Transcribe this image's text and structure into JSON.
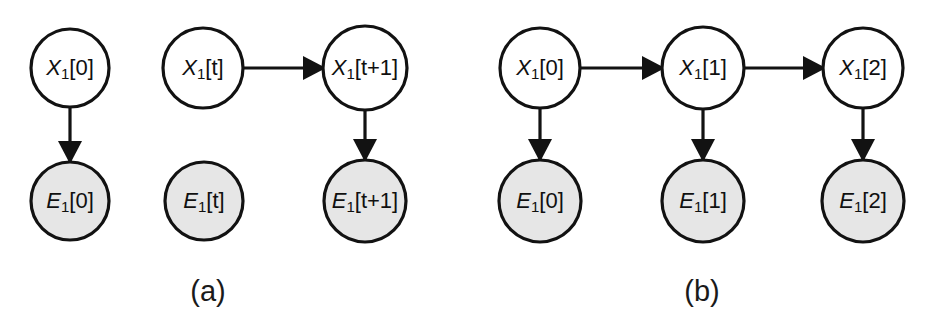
{
  "figure": {
    "background_color": "#ffffff",
    "stroke_color": "#121212",
    "hidden_node_fill": "#ffffff",
    "evidence_node_fill": "#e6e6e6",
    "panels": [
      {
        "id": "a",
        "caption": "(a)",
        "caption_x": 208,
        "caption_y": 293,
        "nodes": [
          {
            "id": "a-x0",
            "kind": "hidden",
            "var": "X",
            "sub": "1",
            "index": "[0]",
            "cx": 70,
            "cy": 68,
            "r": 39
          },
          {
            "id": "a-e0",
            "kind": "evidence",
            "var": "E",
            "sub": "1",
            "index": "[0]",
            "cx": 70,
            "cy": 201,
            "r": 39
          },
          {
            "id": "a-xt",
            "kind": "hidden",
            "var": "X",
            "sub": "1",
            "index": "[t]",
            "cx": 203,
            "cy": 68,
            "r": 40
          },
          {
            "id": "a-et",
            "kind": "evidence",
            "var": "E",
            "sub": "1",
            "index": "[t]",
            "cx": 204,
            "cy": 201,
            "r": 39
          },
          {
            "id": "a-xt1",
            "kind": "hidden",
            "var": "X",
            "sub": "1",
            "index": "[t+1]",
            "cx": 365,
            "cy": 68,
            "r": 42
          },
          {
            "id": "a-et1",
            "kind": "evidence",
            "var": "E",
            "sub": "1",
            "index": "[t+1]",
            "cx": 365,
            "cy": 201,
            "r": 41
          }
        ],
        "edges": [
          {
            "id": "a-edge-x0-e0",
            "from": "a-x0",
            "to": "a-e0",
            "direction": "down"
          },
          {
            "id": "a-edge-xt-xt1",
            "from": "a-xt",
            "to": "a-xt1",
            "direction": "right"
          },
          {
            "id": "a-edge-xt1-et1",
            "from": "a-xt1",
            "to": "a-et1",
            "direction": "down"
          }
        ]
      },
      {
        "id": "b",
        "caption": "(b)",
        "caption_x": 702,
        "caption_y": 293,
        "nodes": [
          {
            "id": "b-x0",
            "kind": "hidden",
            "var": "X",
            "sub": "1",
            "index": "[0]",
            "cx": 540,
            "cy": 68,
            "r": 40
          },
          {
            "id": "b-x1",
            "kind": "hidden",
            "var": "X",
            "sub": "1",
            "index": "[1]",
            "cx": 703,
            "cy": 68,
            "r": 41
          },
          {
            "id": "b-x2",
            "kind": "hidden",
            "var": "X",
            "sub": "1",
            "index": "[2]",
            "cx": 863,
            "cy": 68,
            "r": 40
          },
          {
            "id": "b-e0",
            "kind": "evidence",
            "var": "E",
            "sub": "1",
            "index": "[0]",
            "cx": 540,
            "cy": 201,
            "r": 41
          },
          {
            "id": "b-e1",
            "kind": "evidence",
            "var": "E",
            "sub": "1",
            "index": "[1]",
            "cx": 703,
            "cy": 201,
            "r": 41
          },
          {
            "id": "b-e2",
            "kind": "evidence",
            "var": "E",
            "sub": "1",
            "index": "[2]",
            "cx": 863,
            "cy": 201,
            "r": 41
          }
        ],
        "edges": [
          {
            "id": "b-edge-x0-x1",
            "from": "b-x0",
            "to": "b-x1",
            "direction": "right"
          },
          {
            "id": "b-edge-x1-x2",
            "from": "b-x1",
            "to": "b-x2",
            "direction": "right"
          },
          {
            "id": "b-edge-x0-e0",
            "from": "b-x0",
            "to": "b-e0",
            "direction": "down"
          },
          {
            "id": "b-edge-x1-e1",
            "from": "b-x1",
            "to": "b-e1",
            "direction": "down"
          },
          {
            "id": "b-edge-x2-e2",
            "from": "b-x2",
            "to": "b-e2",
            "direction": "down"
          }
        ]
      }
    ]
  }
}
